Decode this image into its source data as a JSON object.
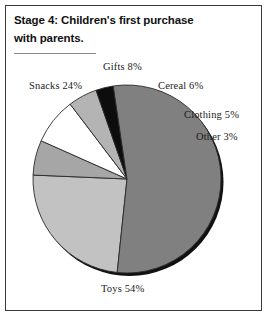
{
  "figure": {
    "title_lines": [
      "Stage 4: Children's first purchase",
      "with parents."
    ],
    "frame_color": "#3a3a3a",
    "rule_color": "#8a8a8a",
    "background": "#ffffff"
  },
  "chart_data": {
    "type": "pie",
    "title": "Stage 4: Children's first purchase with parents.",
    "subtitle": "",
    "xlabel": "",
    "ylabel": "",
    "legend_position": "none",
    "labels_outside": true,
    "units": "percent",
    "total": 100,
    "start_angle_deg": 186,
    "direction": "clockwise",
    "center": {
      "x": 127,
      "y": 179
    },
    "radius": 94,
    "categories": [
      "Snacks",
      "Gifts",
      "Cereal",
      "Clothing",
      "Other",
      "Toys"
    ],
    "values": [
      24,
      8,
      6,
      5,
      3,
      54
    ],
    "slices": [
      {
        "name": "Snacks",
        "value": 24,
        "label": "Snacks 24%",
        "color": "#c2c2c2",
        "start_deg": 186,
        "end_deg": 272.4
      },
      {
        "name": "Cereal",
        "value": 6,
        "label": "Cereal 6%",
        "color": "#a6a6a6",
        "start_deg": 272.4,
        "end_deg": 294.0
      },
      {
        "name": "Gifts",
        "value": 8,
        "label": "Gifts 8%",
        "color": "#ffffff",
        "start_deg": 294.0,
        "end_deg": 322.8
      },
      {
        "name": "Clothing",
        "value": 5,
        "label": "Clothing 5%",
        "color": "#b4b4b4",
        "start_deg": 322.8,
        "end_deg": 340.8
      },
      {
        "name": "Other",
        "value": 3,
        "label": "Other 3%",
        "color": "#0d0d0d",
        "start_deg": 340.8,
        "end_deg": 351.6
      },
      {
        "name": "Toys",
        "value": 54,
        "label": "Toys 54%",
        "color": "#808080",
        "start_deg": 351.6,
        "end_deg": 546.0
      }
    ],
    "slice_outline_color": "#2a2a2a",
    "shadow_color": "#111111"
  },
  "labels": {
    "gifts": "Gifts 8%",
    "snacks": "Snacks 24%",
    "cereal": "Cereal 6%",
    "clothing": "Clothing 5%",
    "other": "Other 3%",
    "toys": "Toys 54%"
  }
}
